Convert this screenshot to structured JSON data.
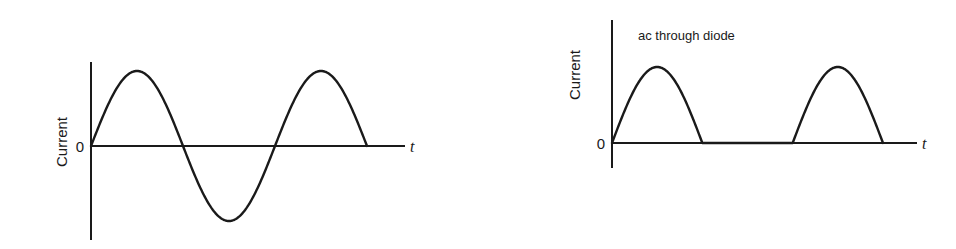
{
  "chart_data": [
    {
      "type": "line",
      "title": "",
      "xlabel": "t",
      "ylabel": "Current",
      "y_tick_labels": [
        "0"
      ],
      "grid": false,
      "legend": null,
      "description": "Full sinusoidal alternating current, 1.5 cycles starting at origin",
      "x": [
        0,
        0.25,
        0.5,
        0.75,
        1.0,
        1.25,
        1.5
      ],
      "values": [
        0,
        1,
        0,
        -1,
        0,
        1,
        0
      ],
      "x_units": "cycles",
      "ylim": [
        -1.05,
        1.05
      ]
    },
    {
      "type": "line",
      "title": "ac through diode",
      "xlabel": "t",
      "ylabel": "Current",
      "y_tick_labels": [
        "0"
      ],
      "grid": false,
      "legend": null,
      "description": "Half-wave rectified current: positive half-cycles only, zero during negative half-cycles",
      "x": [
        0,
        0.25,
        0.5,
        0.75,
        1.0,
        1.25,
        1.5
      ],
      "values": [
        0,
        1,
        0,
        0,
        0,
        1,
        0
      ],
      "x_units": "cycles",
      "ylim": [
        0,
        1.05
      ]
    }
  ],
  "left_chart": {
    "ylabel": "Current",
    "zero_label": "0",
    "xlabel": "t"
  },
  "right_chart": {
    "title": "ac through diode",
    "ylabel": "Current",
    "zero_label": "0",
    "xlabel": "t"
  }
}
